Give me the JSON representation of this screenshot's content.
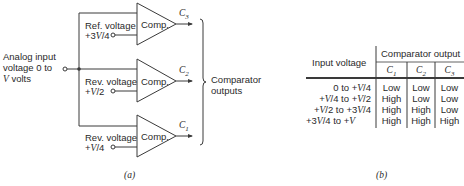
{
  "figure_a": {
    "caption": "(a)",
    "input_label": [
      "Analog input",
      "voltage 0 to",
      "V volts"
    ],
    "comparators": [
      {
        "id": "C3",
        "label": "Comp.",
        "output": "C3",
        "ref_line1": "Ref. voltage",
        "ref_line2": "+3V/4"
      },
      {
        "id": "C2",
        "label": "Comp.",
        "output": "C2",
        "ref_line1": "Rev. voltage",
        "ref_line2": "+V/2"
      },
      {
        "id": "C1",
        "label": "Comp.",
        "output": "C1",
        "ref_line1": "Rev. voltage",
        "ref_line2": "+V/4"
      }
    ],
    "outputs_label": [
      "Comparator",
      "outputs"
    ]
  },
  "figure_b": {
    "caption": "(b)",
    "header": {
      "row_header": "Input voltage",
      "group_header": "Comparator output",
      "columns": [
        "C1",
        "C2",
        "C3"
      ]
    },
    "rows": [
      {
        "input": "0 to +V/4",
        "values": [
          "Low",
          "Low",
          "Low"
        ]
      },
      {
        "input": "+V/4 to +V/2",
        "values": [
          "High",
          "Low",
          "Low"
        ]
      },
      {
        "input": "+V/2 to +3V/4",
        "values": [
          "High",
          "High",
          "Low"
        ]
      },
      {
        "input": "+3V/4 to +V",
        "values": [
          "High",
          "High",
          "High"
        ]
      }
    ]
  },
  "colors": {
    "line": "#3a3a3a",
    "text": "#2a2a2a",
    "background": "#ffffff"
  }
}
